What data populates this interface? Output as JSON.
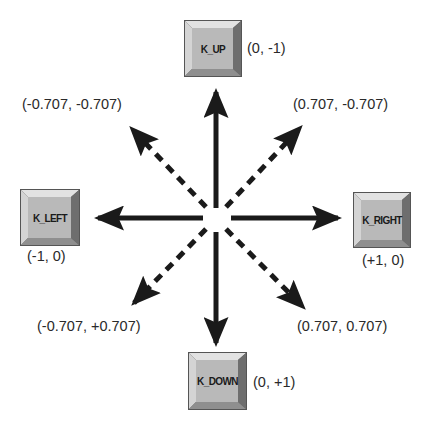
{
  "diagram": {
    "center": {
      "x": 216,
      "y": 218
    },
    "colors": {
      "arrow": "#1a1a1a",
      "key_face": "#b9b9b9",
      "key_bevel_light": "#e2e2e2",
      "key_bevel_dark": "#6e6e6e",
      "key_bevel_mid": "#9a9a9a",
      "key_border": "#555555",
      "text": "#2a2a2a"
    },
    "keys": {
      "up": {
        "label": "K_UP",
        "coord": "(0, -1)"
      },
      "left": {
        "label": "K_LEFT",
        "coord": "(-1, 0)"
      },
      "right": {
        "label": "K_RIGHT",
        "coord": "(+1, 0)"
      },
      "down": {
        "label": "K_DOWN",
        "coord": "(0, +1)"
      }
    },
    "diagonals": {
      "up_left": {
        "coord": "(-0.707, -0.707)",
        "style": "dashed"
      },
      "up_right": {
        "coord": "(0.707, -0.707)",
        "style": "dashed"
      },
      "down_left": {
        "coord": "(-0.707, +0.707)",
        "style": "dashed"
      },
      "down_right": {
        "coord": "(0.707, 0.707)",
        "style": "dashed"
      }
    },
    "arrows": [
      {
        "dir": "up",
        "vector": [
          0,
          -1
        ],
        "style": "solid"
      },
      {
        "dir": "down",
        "vector": [
          0,
          1
        ],
        "style": "solid"
      },
      {
        "dir": "left",
        "vector": [
          -1,
          0
        ],
        "style": "solid"
      },
      {
        "dir": "right",
        "vector": [
          1,
          0
        ],
        "style": "solid"
      },
      {
        "dir": "up-left",
        "vector": [
          -0.707,
          -0.707
        ],
        "style": "dashed"
      },
      {
        "dir": "up-right",
        "vector": [
          0.707,
          -0.707
        ],
        "style": "dashed"
      },
      {
        "dir": "down-left",
        "vector": [
          -0.707,
          0.707
        ],
        "style": "dashed"
      },
      {
        "dir": "down-right",
        "vector": [
          0.707,
          0.707
        ],
        "style": "dashed"
      }
    ]
  }
}
